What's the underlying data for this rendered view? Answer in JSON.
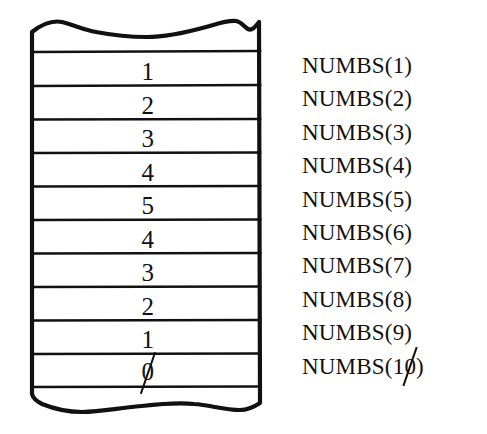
{
  "figure": {
    "kind": "array-memory-diagram",
    "ink_color": "#111111",
    "paper_color": "#ffffff"
  },
  "array": {
    "name": "NUMBS",
    "cell_count": 10,
    "zero_glyph": "slashed-zero",
    "cells": [
      {
        "index": 1,
        "value": "1",
        "label": "NUMBS(1)"
      },
      {
        "index": 2,
        "value": "2",
        "label": "NUMBS(2)"
      },
      {
        "index": 3,
        "value": "3",
        "label": "NUMBS(3)"
      },
      {
        "index": 4,
        "value": "4",
        "label": "NUMBS(4)"
      },
      {
        "index": 5,
        "value": "5",
        "label": "NUMBS(5)"
      },
      {
        "index": 6,
        "value": "4",
        "label": "NUMBS(6)"
      },
      {
        "index": 7,
        "value": "3",
        "label": "NUMBS(7)"
      },
      {
        "index": 8,
        "value": "2",
        "label": "NUMBS(8)"
      },
      {
        "index": 9,
        "value": "1",
        "label": "NUMBS(9)"
      },
      {
        "index": 10,
        "value": "0",
        "label": "NUMBS(10)"
      }
    ],
    "values_sequence": [
      "1",
      "2",
      "3",
      "4",
      "5",
      "4",
      "3",
      "2",
      "1",
      "0"
    ],
    "labels_sequence": [
      "NUMBS(1)",
      "NUMBS(2)",
      "NUMBS(3)",
      "NUMBS(4)",
      "NUMBS(5)",
      "NUMBS(6)",
      "NUMBS(7)",
      "NUMBS(8)",
      "NUMBS(9)",
      "NUMBS(10)"
    ]
  },
  "chart_data": {
    "type": "table",
    "title": "",
    "columns": [
      "value",
      "label"
    ],
    "rows": [
      [
        "1",
        "NUMBS(1)"
      ],
      [
        "2",
        "NUMBS(2)"
      ],
      [
        "3",
        "NUMBS(3)"
      ],
      [
        "4",
        "NUMBS(4)"
      ],
      [
        "5",
        "NUMBS(5)"
      ],
      [
        "4",
        "NUMBS(6)"
      ],
      [
        "3",
        "NUMBS(7)"
      ],
      [
        "2",
        "NUMBS(8)"
      ],
      [
        "1",
        "NUMBS(9)"
      ],
      [
        "0",
        "NUMBS(10)"
      ]
    ]
  }
}
